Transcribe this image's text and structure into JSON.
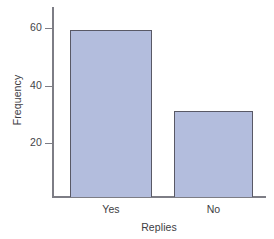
{
  "chart_data": {
    "type": "bar",
    "title": "",
    "xlabel": "Replies",
    "ylabel": "Frequency",
    "categories": [
      "Yes",
      "No"
    ],
    "values": [
      58,
      30
    ],
    "yticks": [
      20,
      40,
      60
    ],
    "ytick_labels": [
      "20",
      "40",
      "60"
    ],
    "ylim": [
      0,
      66
    ],
    "grid": false,
    "legend": false,
    "bar_fill_color": "#b3bddd",
    "bar_edge_color": "#595966",
    "axis_color": "#7d7d85",
    "background_color": "#ffffff"
  },
  "axes": {
    "y_title": "Frequency",
    "x_title": "Replies"
  },
  "ticks": {
    "y": [
      {
        "label": "60",
        "value": 60
      },
      {
        "label": "40",
        "value": 40
      },
      {
        "label": "20",
        "value": 20
      }
    ]
  },
  "bars": [
    {
      "label": "Yes",
      "value": 58
    },
    {
      "label": "No",
      "value": 30
    }
  ]
}
